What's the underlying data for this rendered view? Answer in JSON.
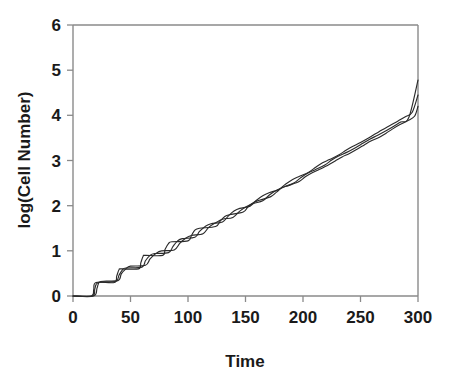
{
  "chart_data": {
    "type": "line",
    "title": "",
    "xlabel": "Time",
    "ylabel": "log(Cell Number)",
    "xlim": [
      0,
      300
    ],
    "ylim": [
      0,
      6
    ],
    "xticks": [
      0,
      50,
      100,
      150,
      200,
      250,
      300
    ],
    "yticks": [
      0,
      1,
      2,
      3,
      4,
      5,
      6
    ],
    "grid": false,
    "legend": "none",
    "series": [
      {
        "name": "curve-1",
        "color": "#2b2b2b",
        "x": [
          0,
          16,
          18,
          20,
          36,
          38,
          40,
          42,
          57,
          59,
          61,
          63,
          78,
          80,
          83,
          86,
          100,
          103,
          106,
          110,
          124,
          128,
          132,
          136,
          148,
          152,
          157,
          162,
          172,
          177,
          182,
          188,
          197,
          202,
          208,
          214,
          222,
          228,
          234,
          240,
          247,
          253,
          259,
          266,
          272,
          278,
          284,
          291,
          297,
          300
        ],
        "y": [
          0.0,
          0.0,
          0.14,
          0.3,
          0.3,
          0.44,
          0.58,
          0.6,
          0.6,
          0.74,
          0.88,
          0.9,
          0.9,
          1.03,
          1.16,
          1.2,
          1.22,
          1.34,
          1.46,
          1.5,
          1.54,
          1.66,
          1.76,
          1.8,
          1.86,
          1.97,
          2.07,
          2.12,
          2.2,
          2.3,
          2.4,
          2.45,
          2.54,
          2.64,
          2.73,
          2.8,
          2.9,
          2.99,
          3.08,
          3.15,
          3.25,
          3.34,
          3.43,
          3.51,
          3.6,
          3.7,
          3.79,
          3.88,
          3.98,
          4.2
        ]
      },
      {
        "name": "curve-2",
        "color": "#2b2b2b",
        "x": [
          0,
          17,
          19,
          22,
          37,
          40,
          43,
          46,
          60,
          63,
          67,
          71,
          83,
          87,
          91,
          95,
          106,
          110,
          115,
          120,
          130,
          135,
          140,
          145,
          154,
          159,
          165,
          171,
          179,
          185,
          191,
          197,
          205,
          211,
          217,
          223,
          231,
          237,
          243,
          250,
          257,
          263,
          269,
          276,
          283,
          289,
          295,
          300
        ],
        "y": [
          0.0,
          0.0,
          0.16,
          0.3,
          0.32,
          0.46,
          0.58,
          0.62,
          0.64,
          0.78,
          0.9,
          0.94,
          0.96,
          1.1,
          1.22,
          1.27,
          1.3,
          1.43,
          1.54,
          1.6,
          1.64,
          1.77,
          1.88,
          1.94,
          1.99,
          2.11,
          2.22,
          2.29,
          2.36,
          2.48,
          2.58,
          2.65,
          2.74,
          2.85,
          2.95,
          3.02,
          3.12,
          3.22,
          3.31,
          3.4,
          3.5,
          3.59,
          3.68,
          3.78,
          3.88,
          3.97,
          4.07,
          4.45
        ]
      },
      {
        "name": "curve-3",
        "color": "#2b2b2b",
        "x": [
          0,
          18,
          21,
          24,
          39,
          42,
          46,
          50,
          63,
          67,
          72,
          77,
          88,
          93,
          98,
          103,
          113,
          118,
          124,
          130,
          139,
          145,
          151,
          157,
          165,
          171,
          177,
          184,
          192,
          198,
          204,
          211,
          219,
          225,
          231,
          238,
          246,
          252,
          258,
          265,
          273,
          279,
          285,
          292,
          300
        ],
        "y": [
          0.0,
          0.0,
          0.18,
          0.32,
          0.34,
          0.49,
          0.6,
          0.66,
          0.68,
          0.82,
          0.94,
          1.0,
          1.02,
          1.17,
          1.28,
          1.34,
          1.38,
          1.52,
          1.62,
          1.7,
          1.74,
          1.88,
          1.98,
          2.05,
          2.11,
          2.24,
          2.34,
          2.42,
          2.5,
          2.62,
          2.72,
          2.8,
          2.9,
          3.01,
          3.1,
          3.18,
          3.29,
          3.38,
          3.47,
          3.56,
          3.67,
          3.76,
          3.85,
          3.95,
          4.78
        ]
      }
    ]
  },
  "axes": {
    "x_tick_labels": [
      "0",
      "50",
      "100",
      "150",
      "200",
      "250",
      "300"
    ],
    "y_tick_labels": [
      "0",
      "1",
      "2",
      "3",
      "4",
      "5",
      "6"
    ],
    "x_axis_title": "Time",
    "y_axis_title": "log(Cell Number)"
  },
  "colors": {
    "line": "#2b2b2b",
    "axis": "#8a8a8a",
    "text": "#1a1a1a",
    "background": "#ffffff"
  }
}
